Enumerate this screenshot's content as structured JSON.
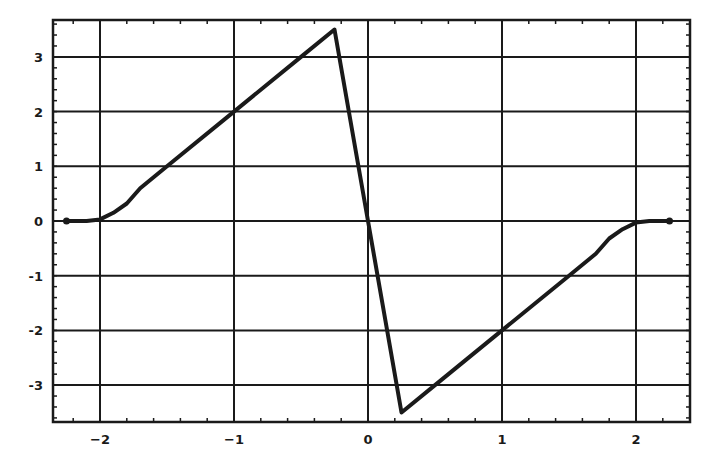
{
  "chart_data": {
    "type": "line",
    "title": "",
    "xlabel": "",
    "ylabel": "",
    "xlim": [
      -2.3,
      2.3
    ],
    "ylim": [
      -3.7,
      3.7
    ],
    "grid": true,
    "legend": null,
    "x_ticks": [
      -2,
      -1,
      0,
      1,
      2
    ],
    "x_tick_labels": [
      "-2",
      "-1",
      "0",
      "1",
      "2"
    ],
    "y_ticks": [
      -3,
      -2,
      -1,
      0,
      1,
      2,
      3
    ],
    "y_tick_labels": [
      "-3",
      "-2",
      "-1",
      "0",
      "1",
      "2",
      "3"
    ],
    "minor_tick_step": 0.2,
    "series": [
      {
        "name": "f(x)",
        "color": "#1a1a1a",
        "markers_at_ends": true,
        "x": [
          -2.25,
          -2.1,
          -2.0,
          -1.9,
          -1.8,
          -1.7,
          -1.5,
          -1.0,
          -0.5,
          -0.25,
          0.0,
          0.25,
          0.5,
          1.0,
          1.5,
          1.7,
          1.8,
          1.9,
          2.0,
          2.1,
          2.25
        ],
        "y": [
          0.0,
          0.0,
          0.03,
          0.15,
          0.32,
          0.6,
          1.0,
          2.0,
          3.0,
          3.5,
          0.0,
          -3.5,
          -3.0,
          -2.0,
          -1.0,
          -0.6,
          -0.32,
          -0.15,
          -0.03,
          0.0,
          0.0
        ]
      }
    ]
  }
}
